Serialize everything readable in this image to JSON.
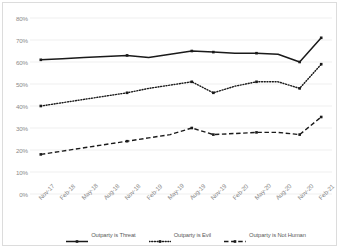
{
  "chart_data": {
    "type": "line",
    "title": "",
    "xlabel": "",
    "ylabel": "",
    "ylim": [
      0,
      80
    ],
    "grid": true,
    "legend_position": "bottom",
    "y_tick_labels": [
      "80%",
      "70%",
      "60%",
      "50%",
      "40%",
      "30%",
      "20%",
      "10%",
      "0%"
    ],
    "y_tick_values": [
      80,
      70,
      60,
      50,
      40,
      30,
      20,
      10,
      0
    ],
    "categories": [
      "Nov-17",
      "Feb-18",
      "May-18",
      "Aug-18",
      "Nov-18",
      "Feb-19",
      "May-19",
      "Aug-19",
      "Nov-19",
      "Feb-20",
      "May-20",
      "Aug-20",
      "Nov-20",
      "Feb-21"
    ],
    "series": [
      {
        "name": "Outparty is Threat",
        "style": "solid",
        "color": "#1a1a1a",
        "values": [
          61,
          61.5,
          62,
          62.5,
          63,
          62,
          63.5,
          65,
          64.5,
          64,
          64,
          63.5,
          60,
          71
        ]
      },
      {
        "name": "Outparty is Evil",
        "style": "dotted",
        "color": "#1a1a1a",
        "values": [
          40,
          41.5,
          43,
          44.5,
          46,
          48,
          49.5,
          51,
          46,
          49,
          51,
          51,
          48,
          59
        ]
      },
      {
        "name": "Outparty is Not Human",
        "style": "dashed",
        "color": "#1a1a1a",
        "values": [
          18,
          19.5,
          21,
          22.5,
          24,
          25.5,
          27,
          30,
          27,
          27.5,
          28,
          28,
          27,
          35
        ]
      }
    ],
    "marker_indices": [
      0,
      4,
      7,
      8,
      10,
      12,
      13
    ]
  },
  "legend": {
    "items": [
      {
        "label": "Outparty is Threat",
        "style": "solid"
      },
      {
        "label": "Outparty is Evil",
        "style": "dotted"
      },
      {
        "label": "Outparty is Not Human",
        "style": "dashed"
      }
    ]
  }
}
